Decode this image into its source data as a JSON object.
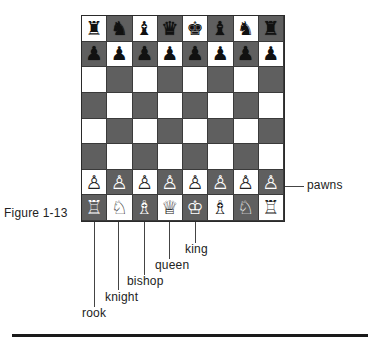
{
  "figure": {
    "caption": "Figure 1-13",
    "colors": {
      "light_square": "#ffffff",
      "dark_square": "#5f5f5f",
      "rule": "#1a1a1a"
    }
  },
  "board": {
    "rows": [
      [
        "♜",
        "♞",
        "♝",
        "♛",
        "♚",
        "♝",
        "♞",
        "♜"
      ],
      [
        "♟",
        "♟",
        "♟",
        "♟",
        "♟",
        "♟",
        "♟",
        "♟"
      ],
      [
        "",
        "",
        "",
        "",
        "",
        "",
        "",
        ""
      ],
      [
        "",
        "",
        "",
        "",
        "",
        "",
        "",
        ""
      ],
      [
        "",
        "",
        "",
        "",
        "",
        "",
        "",
        ""
      ],
      [
        "",
        "",
        "",
        "",
        "",
        "",
        "",
        ""
      ],
      [
        "♙",
        "♙",
        "♙",
        "♙",
        "♙",
        "♙",
        "♙",
        "♙"
      ],
      [
        "♖",
        "♘",
        "♗",
        "♕",
        "♔",
        "♗",
        "♘",
        "♖"
      ]
    ],
    "piece_colors": [
      [
        "b",
        "b",
        "b",
        "b",
        "b",
        "b",
        "b",
        "b"
      ],
      [
        "b",
        "b",
        "b",
        "b",
        "b",
        "b",
        "b",
        "b"
      ],
      [
        "",
        "",
        "",
        "",
        "",
        "",
        "",
        ""
      ],
      [
        "",
        "",
        "",
        "",
        "",
        "",
        "",
        ""
      ],
      [
        "",
        "",
        "",
        "",
        "",
        "",
        "",
        ""
      ],
      [
        "",
        "",
        "",
        "",
        "",
        "",
        "",
        ""
      ],
      [
        "w",
        "w",
        "w",
        "w",
        "w",
        "w",
        "w",
        "w"
      ],
      [
        "w",
        "w",
        "w",
        "w",
        "w",
        "w",
        "w",
        "w"
      ]
    ]
  },
  "callouts": {
    "pawns": "pawns",
    "king": "king",
    "queen": "queen",
    "bishop": "bishop",
    "knight": "knight",
    "rook": "rook"
  }
}
